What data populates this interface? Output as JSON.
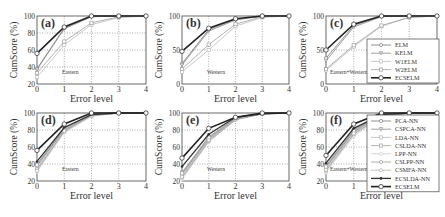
{
  "figure": {
    "xlabel": "Error level",
    "ylabel": "CumScore (%)"
  },
  "colors": {
    "axis": "#444444",
    "grid": "#777777",
    "highlight": "#222222",
    "series_gray": [
      "#777777",
      "#888888",
      "#bbbbbb",
      "#a0a0a0",
      "#cccccc",
      "#999999",
      "#b0b0b0",
      "#444444"
    ]
  },
  "chart_data": [
    {
      "type": "line",
      "panel": "(a)",
      "annotation": "Eastern",
      "xlabel": "Error level",
      "ylabel": "CumScore (%)",
      "x": [
        0,
        1,
        2,
        3,
        4
      ],
      "ylim": [
        20,
        100
      ],
      "yticks": [
        20,
        40,
        60,
        80,
        100
      ],
      "grid": true,
      "legend": null,
      "series": [
        {
          "name": "ELM",
          "values": [
            38,
            86,
            100,
            100,
            100
          ]
        },
        {
          "name": "KELM",
          "values": [
            37,
            85,
            99,
            100,
            100
          ]
        },
        {
          "name": "W1ELM",
          "values": [
            28,
            66,
            90,
            98,
            100
          ]
        },
        {
          "name": "W2ELM",
          "values": [
            33,
            70,
            92,
            99,
            100
          ]
        },
        {
          "name": "ECSELM",
          "values": [
            56,
            87,
            100,
            100,
            100
          ]
        }
      ]
    },
    {
      "type": "line",
      "panel": "(b)",
      "annotation": "Western",
      "xlabel": "Error level",
      "ylabel": "CumScore (%)",
      "x": [
        0,
        1,
        2,
        3,
        4
      ],
      "ylim": [
        0,
        100
      ],
      "yticks": [
        0,
        50,
        100
      ],
      "grid": true,
      "legend": null,
      "series": [
        {
          "name": "ELM",
          "values": [
            30,
            80,
            95,
            100,
            100
          ]
        },
        {
          "name": "KELM",
          "values": [
            28,
            78,
            94,
            100,
            100
          ]
        },
        {
          "name": "W1ELM",
          "values": [
            18,
            50,
            85,
            98,
            100
          ]
        },
        {
          "name": "W2ELM",
          "values": [
            22,
            58,
            88,
            99,
            100
          ]
        },
        {
          "name": "ECSELM",
          "values": [
            48,
            82,
            96,
            100,
            100
          ]
        }
      ]
    },
    {
      "type": "line",
      "panel": "(c)",
      "annotation": "Eastern+Western",
      "xlabel": "Error level",
      "ylabel": "CumScore (%)",
      "x": [
        0,
        1,
        2,
        3,
        4
      ],
      "ylim": [
        0,
        100
      ],
      "yticks": [
        0,
        50,
        100
      ],
      "grid": true,
      "legend_position": "lower right",
      "series": [
        {
          "name": "ELM",
          "values": [
            38,
            86,
            100,
            100,
            100
          ]
        },
        {
          "name": "KELM",
          "values": [
            34,
            84,
            99,
            100,
            100
          ]
        },
        {
          "name": "W1ELM",
          "values": [
            20,
            55,
            85,
            98,
            100
          ]
        },
        {
          "name": "W2ELM",
          "values": [
            22,
            57,
            86,
            98,
            100
          ]
        },
        {
          "name": "ECSELM",
          "values": [
            50,
            88,
            100,
            100,
            100
          ]
        }
      ]
    },
    {
      "type": "line",
      "panel": "(d)",
      "annotation": "Eastern",
      "xlabel": "Error level",
      "ylabel": "CumScore (%)",
      "x": [
        0,
        1,
        2,
        3,
        4
      ],
      "ylim": [
        20,
        100
      ],
      "yticks": [
        20,
        40,
        60,
        80,
        100
      ],
      "grid": true,
      "legend": null,
      "series": [
        {
          "name": "PCA-NN",
          "values": [
            38,
            80,
            97,
            100,
            100
          ]
        },
        {
          "name": "CSPCA-NN",
          "values": [
            40,
            82,
            98,
            100,
            100
          ]
        },
        {
          "name": "LDA-NN",
          "values": [
            36,
            79,
            97,
            100,
            100
          ]
        },
        {
          "name": "CSLDA-NN",
          "values": [
            39,
            81,
            98,
            100,
            100
          ]
        },
        {
          "name": "LPP-NN",
          "values": [
            31,
            77,
            96,
            100,
            100
          ]
        },
        {
          "name": "CSLPP-NN",
          "values": [
            34,
            78,
            97,
            100,
            100
          ]
        },
        {
          "name": "CSMFA-NN",
          "values": [
            32,
            79,
            97,
            100,
            100
          ]
        },
        {
          "name": "ECSLDA-NN",
          "values": [
            43,
            83,
            98,
            100,
            100
          ]
        },
        {
          "name": "ECSELM",
          "values": [
            56,
            87,
            100,
            100,
            100
          ]
        }
      ]
    },
    {
      "type": "line",
      "panel": "(e)",
      "annotation": "Western",
      "xlabel": "Error level",
      "ylabel": "CumScore (%)",
      "x": [
        0,
        1,
        2,
        3,
        4
      ],
      "ylim": [
        20,
        100
      ],
      "yticks": [
        20,
        40,
        60,
        80,
        100
      ],
      "grid": true,
      "legend": null,
      "series": [
        {
          "name": "PCA-NN",
          "values": [
            28,
            70,
            93,
            99,
            100
          ]
        },
        {
          "name": "CSPCA-NN",
          "values": [
            30,
            72,
            94,
            99,
            100
          ]
        },
        {
          "name": "LDA-NN",
          "values": [
            26,
            69,
            93,
            99,
            100
          ]
        },
        {
          "name": "CSLDA-NN",
          "values": [
            29,
            71,
            94,
            99,
            100
          ]
        },
        {
          "name": "LPP-NN",
          "values": [
            22,
            66,
            92,
            99,
            100
          ]
        },
        {
          "name": "CSLPP-NN",
          "values": [
            24,
            67,
            92,
            99,
            100
          ]
        },
        {
          "name": "CSMFA-NN",
          "values": [
            25,
            68,
            93,
            99,
            100
          ]
        },
        {
          "name": "ECSLDA-NN",
          "values": [
            37,
            75,
            95,
            99,
            100
          ]
        },
        {
          "name": "ECSELM",
          "values": [
            47,
            82,
            95,
            100,
            100
          ]
        }
      ]
    },
    {
      "type": "line",
      "panel": "(f)",
      "annotation": "Eastern+Western",
      "xlabel": "Error level",
      "ylabel": "CumScore (%)",
      "x": [
        0,
        1,
        2,
        3,
        4
      ],
      "ylim": [
        20,
        100
      ],
      "yticks": [
        20,
        40,
        60,
        80,
        100
      ],
      "grid": true,
      "legend_position": "right",
      "series": [
        {
          "name": "PCA-NN",
          "values": [
            36,
            78,
            97,
            100,
            100
          ]
        },
        {
          "name": "CSPCA-NN",
          "values": [
            38,
            80,
            98,
            100,
            100
          ]
        },
        {
          "name": "LDA-NN",
          "values": [
            35,
            77,
            97,
            100,
            100
          ]
        },
        {
          "name": "CSLDA-NN",
          "values": [
            37,
            79,
            98,
            100,
            100
          ]
        },
        {
          "name": "LPP-NN",
          "values": [
            30,
            73,
            95,
            100,
            100
          ]
        },
        {
          "name": "CSLPP-NN",
          "values": [
            32,
            75,
            96,
            100,
            100
          ]
        },
        {
          "name": "CSMFA-NN",
          "values": [
            33,
            76,
            96,
            100,
            100
          ]
        },
        {
          "name": "ECSLDA-NN",
          "values": [
            41,
            82,
            98,
            100,
            100
          ]
        },
        {
          "name": "ECSELM",
          "values": [
            50,
            87,
            100,
            100,
            100
          ]
        }
      ]
    }
  ]
}
